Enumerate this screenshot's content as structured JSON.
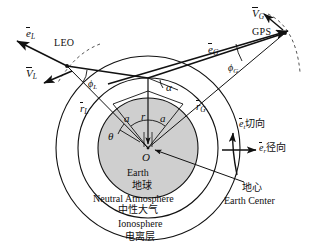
{
  "figure": {
    "colors": {
      "stroke": "#111111",
      "earth_fill": "#cfcfcf",
      "atmosphere_fill": "#ffffff",
      "ionosphere_fill": "#ffffff",
      "background": "#ffffff",
      "dashed_orbit": "#555555"
    }
  },
  "labels": {
    "leo_name": "LEO",
    "gps_name": "GPS",
    "origin": "O",
    "e_leo": {
      "symbol": "e",
      "sub": "L"
    },
    "v_leo": {
      "symbol": "V",
      "sub": "L"
    },
    "r_leo": {
      "symbol": "r",
      "sub": "L"
    },
    "phi_leo": {
      "symbol": "ϕ",
      "sub": "L"
    },
    "e_gps": {
      "symbol": "e",
      "sub": "G"
    },
    "v_gps": {
      "symbol": "V",
      "sub": "G"
    },
    "r_gps": {
      "symbol": "r",
      "sub": "G"
    },
    "phi_gps": {
      "symbol": "ϕ",
      "sub": "G"
    },
    "e_tangential": {
      "symbol": "e",
      "sub": "t",
      "text": "切向"
    },
    "e_radial": {
      "symbol": "e",
      "sub": "r",
      "text": "径向"
    },
    "alpha_top": "α",
    "alpha_left": "a",
    "alpha_right": "a",
    "radius_r": "r",
    "theta": "θ",
    "earth_en": "Earth",
    "earth_cn": "地球",
    "neutral_atmosphere_en": "Neutral Atmosphere",
    "neutral_atmosphere_cn": "中性大气",
    "ionosphere_en": "Ionosphere",
    "ionosphere_cn": "电离层",
    "earth_center_cn": "地心",
    "earth_center_en": "Earth Center"
  },
  "geometry": {
    "center": {
      "x": 148,
      "y": 148
    },
    "earth_radius": 50,
    "atmosphere_radius": 70,
    "ionosphere_radius": 92,
    "leo_point": {
      "x": 67,
      "y": 66
    },
    "gps_point": {
      "x": 285,
      "y": 33
    },
    "tangent_point": {
      "x": 148,
      "y": 78
    }
  }
}
